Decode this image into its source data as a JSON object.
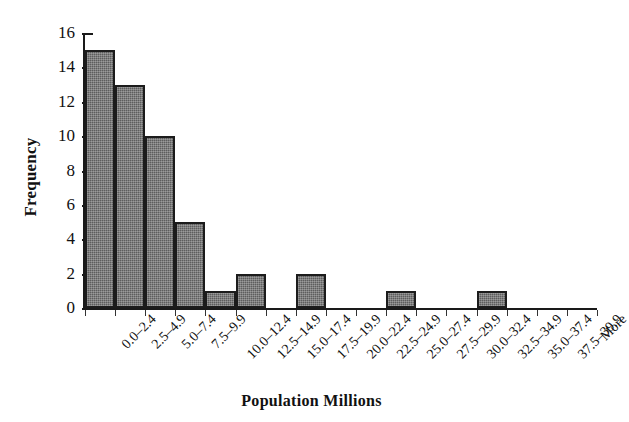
{
  "chart_data": {
    "type": "bar",
    "title": "",
    "subtitle": "",
    "xlabel": "Population Millions",
    "ylabel": "Frequency",
    "categories": [
      "0.0–2.4",
      "2.5–4.9",
      "5.0–7.4",
      "7.5–9.9",
      "10.0–12.4",
      "12.5–14.9",
      "15.0–17.4",
      "17.5–19.9",
      "20.0–22.4",
      "22.5–24.9",
      "25.0–27.4",
      "27.5–29.9",
      "30.0–32.4",
      "32.5–34.9",
      "35.0–37.4",
      "37.5–39.9",
      "More"
    ],
    "values": [
      15,
      13,
      10,
      5,
      1,
      2,
      0,
      2,
      0,
      0,
      1,
      0,
      0,
      1,
      0,
      0,
      0
    ],
    "ylim": [
      0,
      16
    ],
    "yticks": [
      0,
      2,
      4,
      6,
      8,
      10,
      12,
      14,
      16
    ],
    "ytick_labels": [
      "0",
      "2",
      "4",
      "6",
      "8",
      "10",
      "12",
      "14",
      "16"
    ],
    "grid": false,
    "legend": false,
    "legend_position": "none",
    "bar_fill_color": "#5d5d5d",
    "bar_border_color": "#1c1c1c",
    "axis_color": "#1a1a1a",
    "background_color": "#ffffff",
    "histogram_contiguous_bars": true
  }
}
